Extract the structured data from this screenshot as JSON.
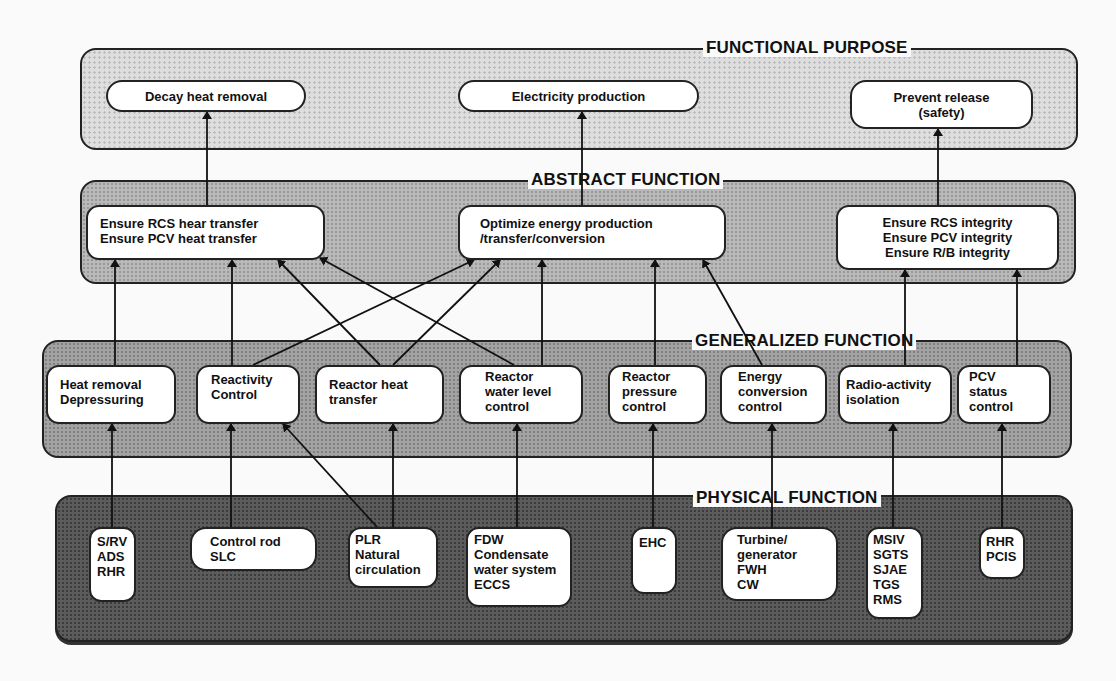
{
  "levels": {
    "functional_purpose": {
      "title": "FUNCTIONAL PURPOSE",
      "nodes": {
        "decay": "Decay heat removal",
        "electricity": "Electricity production",
        "prevent": "Prevent release\n(safety)"
      }
    },
    "abstract_function": {
      "title": "ABSTRACT FUNCTION",
      "nodes": {
        "rcs_heat": "Ensure RCS hear transfer\nEnsure PCV heat transfer",
        "optimize": "Optimize energy production\n/transfer/conversion",
        "integrity": "Ensure RCS integrity\nEnsure PCV integrity\nEnsure R/B integrity"
      }
    },
    "generalized_function": {
      "title": "GENERALIZED FUNCTION",
      "nodes": {
        "heat_removal": "Heat removal\nDepressuring",
        "reactivity": "Reactivity\nControl",
        "reactor_heat": "Reactor heat\ntransfer",
        "water_level": "Reactor\nwater level\ncontrol",
        "pressure": "Reactor\npressure\ncontrol",
        "energy_conv": "Energy\nconversion\ncontrol",
        "radio": "Radio-activity\nisolation",
        "pcv_status": "PCV\nstatus\ncontrol"
      }
    },
    "physical_function": {
      "title": "PHYSICAL FUNCTION",
      "nodes": {
        "srv": "S/RV\nADS\nRHR",
        "control_rod": "Control rod\nSLC",
        "plr": "PLR\nNatural\ncirculation",
        "fdw": "FDW\nCondensate\nwater system\nECCS",
        "ehc": "EHC",
        "turbine": "Turbine/\ngenerator\nFWH\nCW",
        "msiv": "MSIV\nSGTS\nSJAE\nTGS\nRMS",
        "rhr": "RHR\nPCIS"
      }
    }
  },
  "links": [
    [
      "rcs_heat",
      "decay"
    ],
    [
      "optimize",
      "electricity"
    ],
    [
      "integrity",
      "prevent"
    ],
    [
      "heat_removal",
      "rcs_heat"
    ],
    [
      "reactivity",
      "rcs_heat"
    ],
    [
      "reactivity",
      "optimize"
    ],
    [
      "reactor_heat",
      "rcs_heat"
    ],
    [
      "reactor_heat",
      "optimize"
    ],
    [
      "water_level",
      "rcs_heat"
    ],
    [
      "water_level",
      "optimize"
    ],
    [
      "pressure",
      "optimize"
    ],
    [
      "energy_conv",
      "optimize"
    ],
    [
      "radio",
      "integrity"
    ],
    [
      "pcv_status",
      "integrity"
    ],
    [
      "srv",
      "heat_removal"
    ],
    [
      "control_rod",
      "reactivity"
    ],
    [
      "plr",
      "reactivity"
    ],
    [
      "plr",
      "reactor_heat"
    ],
    [
      "fdw",
      "water_level"
    ],
    [
      "ehc",
      "pressure"
    ],
    [
      "turbine",
      "energy_conv"
    ],
    [
      "msiv",
      "radio"
    ],
    [
      "rhr",
      "pcv_status"
    ]
  ],
  "colors": {
    "functional_purpose_fill": "#dedede",
    "abstract_function_fill": "#b9b9b9",
    "generalized_function_fill": "#a3a3a3",
    "physical_function_fill": "#5c5c5c"
  }
}
